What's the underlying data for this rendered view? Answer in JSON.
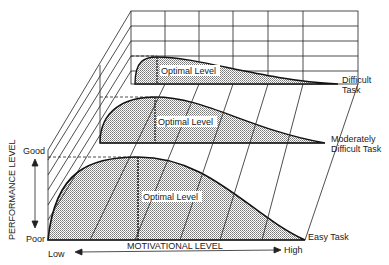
{
  "diagram": {
    "y_axis": {
      "title": "PERFORMANCE LEVEL",
      "top": "Good",
      "bottom": "Poor"
    },
    "x_axis": {
      "title": "MOTIVATIONAL LEVEL",
      "left": "Low",
      "right": "High"
    },
    "curves": [
      {
        "task": "Difficult Task",
        "line1": "Difficult",
        "line2": "Task",
        "optimal": "Optimal Level"
      },
      {
        "task": "Moderately Difficult Task",
        "line1": "Moderately",
        "line2": "Difficult Task",
        "optimal": "Optimal Level"
      },
      {
        "task": "Easy Task",
        "line1": "Easy Task",
        "line2": "",
        "optimal": "Optimal Level"
      }
    ]
  }
}
